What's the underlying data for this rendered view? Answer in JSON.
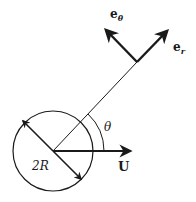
{
  "diagram": {
    "type": "physics-vector-diagram",
    "labels": {
      "e_theta_base": "e",
      "e_theta_sub": "θ",
      "e_r_base": "e",
      "e_r_sub": "r",
      "radius_line": "r",
      "angle": "θ",
      "diameter": "2R",
      "velocity": "U"
    },
    "colors": {
      "stroke": "#1a1a1a",
      "background": "#ffffff"
    },
    "elements": [
      {
        "name": "sphere",
        "shape": "circle",
        "center": [
          53,
          151
        ],
        "radius": 40
      },
      {
        "name": "diameter-arrow",
        "from": [
          22,
          120
        ],
        "to": [
          80,
          179
        ],
        "double_headed": true
      },
      {
        "name": "velocity-arrow",
        "from": [
          53,
          151
        ],
        "to": [
          130,
          151
        ],
        "label": "U"
      },
      {
        "name": "radial-line",
        "from": [
          53,
          151
        ],
        "to": [
          137,
          62
        ],
        "label": "r"
      },
      {
        "name": "angle-arc",
        "label": "θ",
        "radius": 51
      },
      {
        "name": "e-r-arrow",
        "from": [
          137,
          62
        ],
        "to": [
          167,
          31
        ],
        "label": "e_r"
      },
      {
        "name": "e-theta-arrow",
        "from": [
          137,
          62
        ],
        "to": [
          106,
          30
        ],
        "label": "e_θ"
      }
    ]
  }
}
